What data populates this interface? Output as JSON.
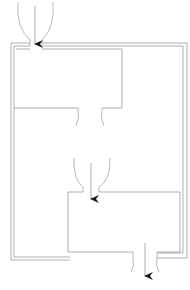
{
  "diagram": {
    "type": "flow-channel-schematic",
    "colors": {
      "background": "#ffffff",
      "wall": "#9a9a9a",
      "flow_line": "#8a8a8a",
      "arrow": "#1a1a1a"
    },
    "components": [
      {
        "id": "inlet-top",
        "kind": "inlet-funnel",
        "arrow": "down"
      },
      {
        "id": "upper-chamber",
        "kind": "chamber"
      },
      {
        "id": "upper-outlet",
        "kind": "outlet-opening"
      },
      {
        "id": "lower-inlet",
        "kind": "inlet-funnel",
        "arrow": "down"
      },
      {
        "id": "lower-chamber",
        "kind": "chamber"
      },
      {
        "id": "outlet-bottom",
        "kind": "outlet-funnel",
        "arrow": "down"
      },
      {
        "id": "outer-channel",
        "kind": "double-wall-channel"
      }
    ]
  }
}
